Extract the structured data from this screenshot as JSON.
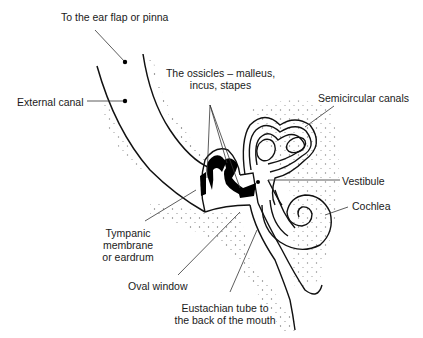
{
  "diagram": {
    "colors": {
      "ink": "#111111",
      "background": "#ffffff",
      "stipple": "#555555"
    },
    "labels": {
      "pinna": "To the ear flap or pinna",
      "external_canal": "External canal",
      "ossicles_line1": "The ossicles – malleus,",
      "ossicles_line2": "incus, stapes",
      "semicircular": "Semicircular canals",
      "vestibule": "Vestibule",
      "cochlea": "Cochlea",
      "tympanic_line1": "Tympanic",
      "tympanic_line2": "membrane",
      "tympanic_line3": "or eardrum",
      "oval_window": "Oval window",
      "eustachian_line1": "Eustachian tube to",
      "eustachian_line2": "the back of the mouth"
    }
  }
}
